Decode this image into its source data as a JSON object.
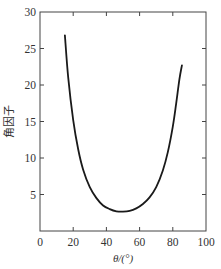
{
  "chart_data": {
    "type": "line",
    "title": "",
    "xlabel": "θ/(°)",
    "ylabel": "角因子",
    "xlim": [
      0,
      100
    ],
    "ylim": [
      0,
      30
    ],
    "xticks": [
      0,
      20,
      40,
      60,
      80,
      100
    ],
    "yticks": [
      5,
      10,
      15,
      20,
      25,
      30
    ],
    "x_tick_labels": [
      "0",
      "20",
      "40",
      "60",
      "80",
      "100"
    ],
    "y_tick_labels": [
      "5",
      "10",
      "15",
      "20",
      "25",
      "30"
    ],
    "grid": false,
    "legend": null,
    "series": [
      {
        "name": "角因子",
        "color": "#1a1a1a",
        "x": [
          15,
          17,
          20,
          23,
          26,
          30,
          34,
          38,
          42,
          46,
          50,
          54,
          58,
          62,
          66,
          70,
          74,
          77,
          80,
          82,
          84,
          85.5
        ],
        "y": [
          26.8,
          21.0,
          15.2,
          11.2,
          8.4,
          6.0,
          4.5,
          3.5,
          3.0,
          2.7,
          2.65,
          2.75,
          3.1,
          3.7,
          4.6,
          6.0,
          8.3,
          10.8,
          14.3,
          17.4,
          20.8,
          22.7
        ]
      }
    ]
  }
}
